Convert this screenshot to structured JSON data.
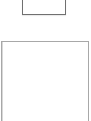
{
  "top_box": {
    "label": ""
  },
  "main_panel": {
    "label": ""
  },
  "colors": {
    "top_border": "#707070",
    "panel_border": "#a8a8a8",
    "background": "#ffffff"
  }
}
